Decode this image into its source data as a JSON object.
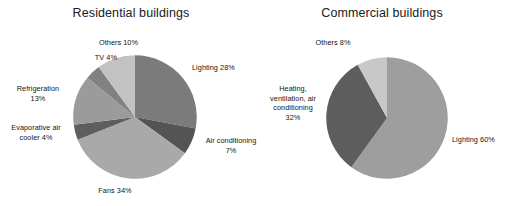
{
  "chart_data": [
    {
      "type": "pie",
      "title": "Residential buildings",
      "categories": [
        "Lighting",
        "Air conditioning",
        "Fans",
        "Evaporative air cooler",
        "Refrigeration",
        "TV",
        "Others"
      ],
      "values": [
        28,
        7,
        34,
        4,
        13,
        4,
        10
      ],
      "unit": "%",
      "labels": [
        "Lighting 28%",
        "Air conditioning\n7%",
        "Fans 34%",
        "Evaporative air\ncooler 4%",
        "Refrigeration\n13%",
        "TV 4%",
        "Others 10%"
      ],
      "colors": [
        "#7b7b7b",
        "#545454",
        "#a9a9a9",
        "#5e5e5e",
        "#9b9b9b",
        "#818181",
        "#c2c2c2"
      ],
      "legend": "none",
      "grid": false,
      "start_angle_deg": 0,
      "direction": "clockwise"
    },
    {
      "type": "pie",
      "title": "Commercial buildings",
      "categories": [
        "Lighting",
        "Heating, ventilation, air conditioning",
        "Others"
      ],
      "values": [
        60,
        32,
        8
      ],
      "unit": "%",
      "labels": [
        "Lighting 60%",
        "Heating,\nventilation, air\nconditioning\n32%",
        "Others 8%"
      ],
      "colors": [
        "#9e9e9e",
        "#5d5d5d",
        "#c8c8c8"
      ],
      "legend": "none",
      "grid": false,
      "start_angle_deg": 0,
      "direction": "clockwise"
    }
  ],
  "residential": {
    "title": "Residential buildings",
    "labels": {
      "lighting": "Lighting 28%",
      "air_conditioning": "Air conditioning\n7%",
      "fans": "Fans 34%",
      "evaporative_air_cooler": "Evaporative air\ncooler 4%",
      "refrigeration": "Refrigeration\n13%",
      "tv": "TV 4%",
      "others": "Others 10%"
    }
  },
  "commercial": {
    "title": "Commercial buildings",
    "labels": {
      "lighting": "Lighting 60%",
      "hvac": "Heating,\nventilation, air\nconditioning\n32%",
      "others": "Others 8%"
    }
  },
  "colors": {
    "background": "#ffffff",
    "text": "#141414",
    "title": "#202020"
  }
}
